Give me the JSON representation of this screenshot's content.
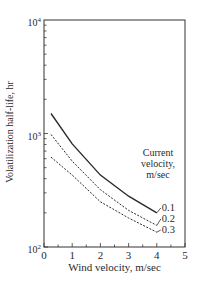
{
  "chart_data": {
    "type": "line",
    "title": "",
    "xlabel": "Wind velocity, m/sec",
    "ylabel": "Volatilization half-life, hr",
    "xlim": [
      0,
      5
    ],
    "ylim": [
      100,
      10000
    ],
    "yscale": "log",
    "grid": false,
    "x_ticks": [
      "0",
      "1",
      "2",
      "3",
      "4",
      "5"
    ],
    "y_ticks": [
      {
        "base": "10",
        "exp": "2",
        "value": 100
      },
      {
        "base": "10",
        "exp": "3",
        "value": 1000
      },
      {
        "base": "10",
        "exp": "4",
        "value": 10000
      }
    ],
    "legend": {
      "title_lines": [
        "Current",
        "velocity,",
        "m/sec"
      ],
      "position": "inline-right"
    },
    "x": [
      0.25,
      1,
      2,
      3,
      4
    ],
    "series": [
      {
        "name": "0.1",
        "style": "solid",
        "values": [
          1500,
          810,
          430,
          280,
          200
        ]
      },
      {
        "name": "0.2",
        "style": "dashed",
        "values": [
          980,
          570,
          320,
          210,
          155
        ]
      },
      {
        "name": "0.3",
        "style": "dashed",
        "values": [
          620,
          430,
          250,
          180,
          135
        ]
      }
    ]
  },
  "colors": {
    "axis": "#333333",
    "line": "#2a2a2a",
    "background": "#ffffff"
  }
}
